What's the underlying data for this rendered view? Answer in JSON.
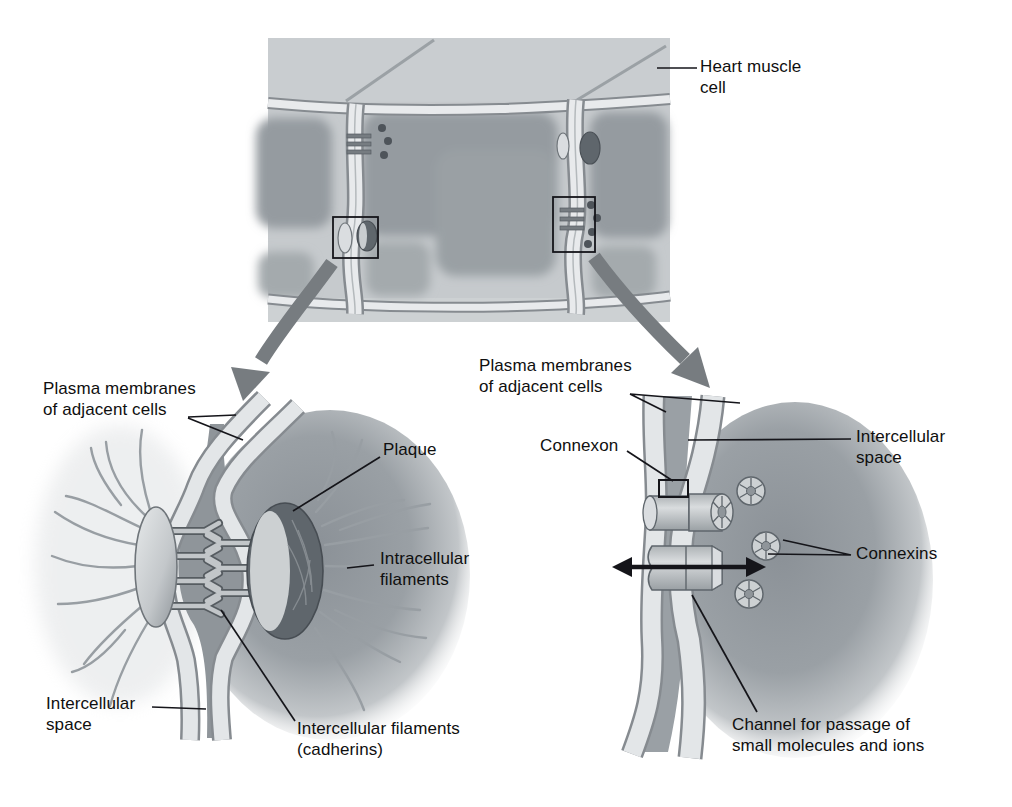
{
  "figure": {
    "description": "Diagram of cell junctions in heart muscle: overview of heart muscle cells with two magnified insets showing a desmosome and a gap junction"
  },
  "colors": {
    "background": "#ffffff",
    "line": "#111111",
    "cell_light": "#c6cacd",
    "cell_dark": "#979da1",
    "membrane_light": "#e8eaec",
    "membrane_edge": "#868b90",
    "plaque_dark": "#5f666c",
    "arrow_gray": "#777c80"
  },
  "heart_illustration": {
    "label_heart_line1": "Heart muscle",
    "label_heart_line2": "cell"
  },
  "desmosome_panel": {
    "plasma_membranes_line1": "Plasma membranes",
    "plasma_membranes_line2": "of adjacent cells",
    "plaque_label": "Plaque",
    "intracellular_filaments_line1": "Intracellular",
    "intracellular_filaments_line2": "filaments",
    "intercellular_space_line1": "Intercellular",
    "intercellular_space_line2": "space",
    "intercellular_filaments_line1": "Intercellular filaments",
    "intercellular_filaments_line2": "(cadherins)"
  },
  "gap_junction_panel": {
    "plasma_membranes_line1": "Plasma membranes",
    "plasma_membranes_line2": "of adjacent cells",
    "connexon_label": "Connexon",
    "intercellular_space_line1": "Intercellular",
    "intercellular_space_line2": "space",
    "connexins_label": "Connexins",
    "channel_line1": "Channel for passage of",
    "channel_line2": "small molecules and ions"
  }
}
